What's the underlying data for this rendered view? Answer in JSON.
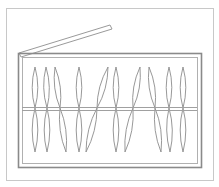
{
  "diagram": {
    "title": "",
    "colors": {
      "background": "#ffffff",
      "frame": "#c8c8c8",
      "box": "#8a8a8a",
      "box_inner": "#b0b0b0",
      "lid": "#9a9a9a",
      "rod": "#a0a0a0",
      "spindle": "#8c8c8c"
    },
    "frame": {
      "x": 6,
      "y": 8,
      "w": 207,
      "h": 172
    },
    "box": {
      "x": 18,
      "y": 53,
      "w": 183,
      "h": 114,
      "inner_inset": 4
    },
    "lid": {
      "points": [
        [
          19,
          53
        ],
        [
          110,
          25
        ],
        [
          112,
          29
        ],
        [
          21,
          57
        ]
      ]
    },
    "rod": {
      "x1": 22,
      "x2": 197,
      "y_top": 107,
      "y_bottom": 110
    },
    "spindles": [
      {
        "top_x": 35,
        "mid_x": 35,
        "bottom_x": 35,
        "half_width": 3.5
      },
      {
        "top_x": 46,
        "mid_x": 47,
        "bottom_x": 47,
        "half_width": 3.5
      },
      {
        "top_x": 55,
        "mid_x": 60,
        "bottom_x": 66,
        "half_width": 3.5
      },
      {
        "top_x": 79,
        "mid_x": 79,
        "bottom_x": 79,
        "half_width": 3.5
      },
      {
        "top_x": 108,
        "mid_x": 97,
        "bottom_x": 86,
        "half_width": 3.5
      },
      {
        "top_x": 116,
        "mid_x": 116,
        "bottom_x": 116,
        "half_width": 3.5
      },
      {
        "top_x": 140,
        "mid_x": 133,
        "bottom_x": 125,
        "half_width": 3.5
      },
      {
        "top_x": 149,
        "mid_x": 155,
        "bottom_x": 161,
        "half_width": 3.5
      },
      {
        "top_x": 169,
        "mid_x": 169,
        "bottom_x": 170,
        "half_width": 3.5
      },
      {
        "top_x": 183,
        "mid_x": 183,
        "bottom_x": 183,
        "half_width": 3.5
      }
    ],
    "spindle_top_y": 67,
    "spindle_bottom_y": 152,
    "spindle_mid_y": 108
  }
}
